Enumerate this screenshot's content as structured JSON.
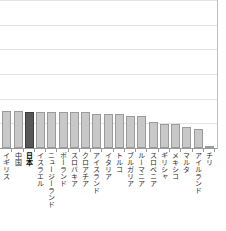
{
  "chart_data": {
    "type": "bar",
    "title": "",
    "subtitle": "",
    "xlabel": "",
    "ylabel": "",
    "ylim": [
      0,
      6
    ],
    "grid": true,
    "gridlines": [
      1,
      2,
      3,
      4,
      5,
      6
    ],
    "legend": "none",
    "note": "Cropped right-hand portion of a larger ranked bar chart; y-axis labels are outside the crop.",
    "highlight_category": "日本",
    "categories": [
      "イギリス",
      "中国",
      "日本",
      "イスラエル",
      "ニュージーランド",
      "ポーランド",
      "スロバキア",
      "クロアチア",
      "アイスランド",
      "イタリア",
      "トルコ",
      "ブルガリア",
      "ルーマニア",
      "スロベニア",
      "ギリシャ",
      "メキシコ",
      "マルタ",
      "アイルランド",
      "チリ"
    ],
    "values": [
      1.5,
      1.5,
      1.47,
      1.47,
      1.45,
      1.45,
      1.44,
      1.44,
      1.36,
      1.36,
      1.36,
      1.28,
      1.28,
      1.07,
      0.99,
      0.99,
      0.86,
      0.77,
      0.07
    ]
  },
  "colors": {
    "bar_fill": "#c8c8c8",
    "bar_border": "#9b9b9b",
    "highlight_fill": "#585858",
    "highlight_border": "#3d3d3d",
    "gridline": "#e3e3e3",
    "axis": "#9a9a9a",
    "label_text": "#2b2b2b"
  }
}
